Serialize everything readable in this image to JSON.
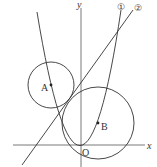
{
  "diagram": {
    "type": "coordinate-geometry",
    "axes": {
      "x_label": "x",
      "y_label": "y",
      "origin_label": "O"
    },
    "curves": [
      {
        "id": "1",
        "label": "①",
        "kind": "parabola"
      },
      {
        "id": "2",
        "label": "②",
        "kind": "line"
      }
    ],
    "circles": [
      {
        "center_label": "A"
      },
      {
        "center_label": "B"
      }
    ],
    "colors": {
      "stroke": "#333333",
      "background": "#ffffff"
    }
  }
}
